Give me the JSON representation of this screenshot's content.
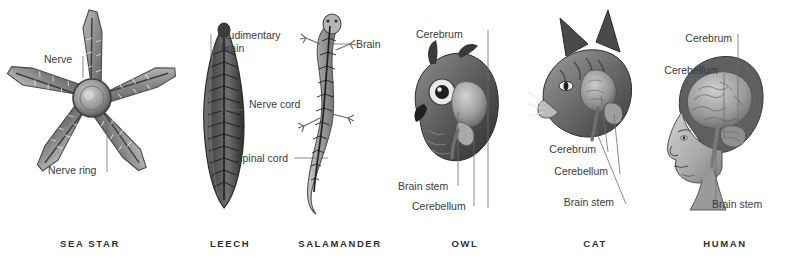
{
  "figure": {
    "background": "#ffffff",
    "ink": "#3a3a3a",
    "leader_color": "#6d6d6d"
  },
  "panels": [
    {
      "id": "sea-star",
      "caption": "SEA STAR",
      "labels": [
        {
          "text": "Nerve"
        },
        {
          "text": "Nerve ring"
        }
      ]
    },
    {
      "id": "leech",
      "caption": "LEECH",
      "labels": [
        {
          "text": "Rudimentary brain"
        },
        {
          "text": "Nerve cord"
        }
      ]
    },
    {
      "id": "salamander",
      "caption": "SALAMANDER",
      "labels": [
        {
          "text": "Brain"
        },
        {
          "text": "Spinal cord"
        }
      ]
    },
    {
      "id": "owl",
      "caption": "OWL",
      "labels": [
        {
          "text": "Cerebrum"
        },
        {
          "text": "Brain stem"
        },
        {
          "text": "Cerebellum"
        }
      ]
    },
    {
      "id": "cat",
      "caption": "CAT",
      "labels": [
        {
          "text": "Cerebrum"
        },
        {
          "text": "Cerebellum"
        },
        {
          "text": "Brain stem"
        }
      ]
    },
    {
      "id": "human",
      "caption": "HUMAN",
      "labels": [
        {
          "text": "Cerebrum"
        },
        {
          "text": "Cerebellum"
        },
        {
          "text": "Brain stem"
        }
      ]
    }
  ]
}
